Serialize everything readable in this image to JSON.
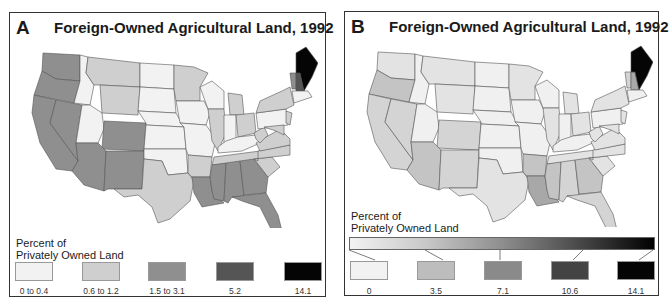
{
  "figure": {
    "panels": [
      {
        "letter": "A",
        "title": "Foreign-Owned Agricultural Land, 1992",
        "map_type": "classed choropleth",
        "legend": {
          "title_line1": "Percent of",
          "title_line2": "Privately Owned Land",
          "classes": [
            {
              "label": "0 to 0.4",
              "color": "#f2f2f2"
            },
            {
              "label": "0.6 to 1.2",
              "color": "#cfcfcf"
            },
            {
              "label": "1.5 to 3.1",
              "color": "#8f8f8f"
            },
            {
              "label": "5.2",
              "color": "#555555"
            },
            {
              "label": "14.1",
              "color": "#050505"
            }
          ]
        }
      },
      {
        "letter": "B",
        "title": "Foreign-Owned Agricultural Land, 1992",
        "map_type": "unclassed choropleth",
        "legend": {
          "title_line1": "Percent of",
          "title_line2": "Privately Owned Land",
          "gradient": {
            "from": "#f2f2f2",
            "to": "#000000"
          },
          "classes": [
            {
              "label": "0",
              "color": "#f2f2f2"
            },
            {
              "label": "3.5",
              "color": "#bdbdbd"
            },
            {
              "label": "7.1",
              "color": "#8a8a8a"
            },
            {
              "label": "10.6",
              "color": "#444444"
            },
            {
              "label": "14.1",
              "color": "#050505"
            }
          ]
        }
      }
    ]
  },
  "colors": {
    "a": {
      "c0": "#f2f2f2",
      "c1": "#cfcfcf",
      "c2": "#8f8f8f",
      "c3": "#555555",
      "c4": "#050505"
    },
    "b": {
      "w": "#f0f0f0",
      "l1": "#e3e3e3",
      "l2": "#d4d4d4",
      "l3": "#c4c4c4",
      "l4": "#a8a8a8",
      "black": "#050505"
    }
  }
}
